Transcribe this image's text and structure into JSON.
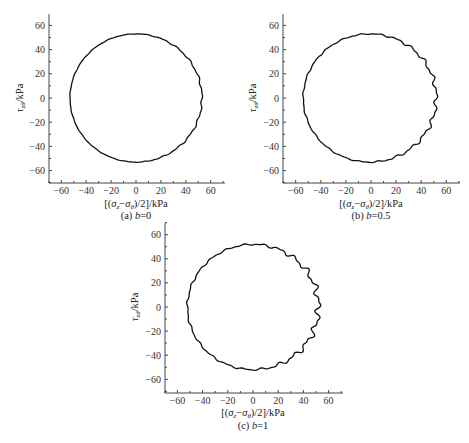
{
  "figure": {
    "panels": [
      {
        "id": "a",
        "caption_prefix": "(a) ",
        "caption_var": "b",
        "caption_value": "=0",
        "xlabel": "[(σz−σθ)/2]/kPa",
        "ylabel": "τzθ/kPa"
      },
      {
        "id": "b",
        "caption_prefix": "(b) ",
        "caption_var": "b",
        "caption_value": "=0.5",
        "xlabel": "[(σz−σθ)/2]/kPa",
        "ylabel": "τzθ/kPa"
      },
      {
        "id": "c",
        "caption_prefix": "(c) ",
        "caption_var": "b",
        "caption_value": "=1",
        "xlabel": "[(σz−σθ)/2]/kPa",
        "ylabel": "τzθ/kPa"
      }
    ]
  },
  "chart_data": [
    {
      "type": "line",
      "title": "(a) b=0",
      "xlabel": "[(σz−σθ)/2]/kPa",
      "ylabel": "τzθ/kPa",
      "xlim": [
        -70,
        70
      ],
      "ylim": [
        -70,
        70
      ],
      "xticks": [
        -60,
        -40,
        -20,
        0,
        20,
        40,
        60
      ],
      "yticks": [
        -60,
        -40,
        -20,
        0,
        20,
        40,
        60
      ],
      "grid": false,
      "legend": null,
      "series": [
        {
          "name": "stress path",
          "shape": "circle",
          "center": [
            0,
            0
          ],
          "radius": 53,
          "noise": 0.6
        }
      ],
      "layout": {
        "ox": 136,
        "oy": 98,
        "sx": 1.245,
        "sy": 1.21,
        "axis_left": 49,
        "axis_right": 225,
        "axis_top": 14,
        "axis_bottom": 183
      }
    },
    {
      "type": "line",
      "title": "(b) b=0.5",
      "xlabel": "[(σz−σθ)/2]/kPa",
      "ylabel": "τzθ/kPa",
      "xlim": [
        -70,
        70
      ],
      "ylim": [
        -70,
        70
      ],
      "xticks": [
        -60,
        -40,
        -20,
        0,
        20,
        40,
        60
      ],
      "yticks": [
        -60,
        -40,
        -20,
        0,
        20,
        40,
        60
      ],
      "grid": false,
      "legend": null,
      "series": [
        {
          "name": "stress path",
          "shape": "circle",
          "center": [
            -1,
            0
          ],
          "radius": 53,
          "noise": 1.4
        }
      ],
      "layout": {
        "ox": 371,
        "oy": 98,
        "sx": 1.255,
        "sy": 1.21,
        "axis_left": 283,
        "axis_right": 460,
        "axis_top": 14,
        "axis_bottom": 183
      }
    },
    {
      "type": "line",
      "title": "(c) b=1",
      "xlabel": "[(σz−σθ)/2]/kPa",
      "ylabel": "τzθ/kPa",
      "xlim": [
        -70,
        70
      ],
      "ylim": [
        -70,
        70
      ],
      "xticks": [
        -60,
        -40,
        -20,
        0,
        20,
        40,
        60
      ],
      "yticks": [
        -60,
        -40,
        -20,
        0,
        20,
        40,
        60
      ],
      "grid": false,
      "legend": null,
      "series": [
        {
          "name": "stress path",
          "shape": "circle",
          "center": [
            0,
            0
          ],
          "radius": 52,
          "noise": 2.2
        }
      ],
      "layout": {
        "ox": 253,
        "oy": 307,
        "sx": 1.26,
        "sy": 1.205,
        "axis_left": 165,
        "axis_right": 343,
        "axis_top": 223,
        "axis_bottom": 393
      }
    }
  ]
}
